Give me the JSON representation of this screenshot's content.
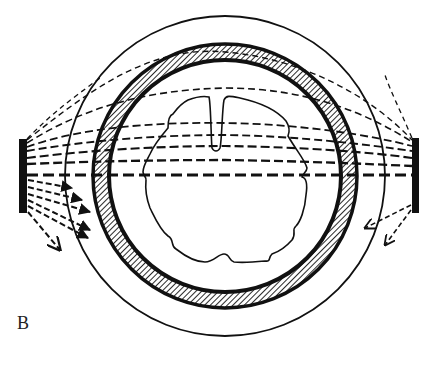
{
  "figure": {
    "panel_label": "B",
    "colors": {
      "ink": "#111111",
      "background": "#ffffff"
    },
    "elements": {
      "outer_circle": {
        "cx": 225,
        "cy": 176,
        "r": 160
      },
      "skull_ring": {
        "cx": 225,
        "cy": 176,
        "r_outer": 133,
        "r_inner": 115,
        "fill": "hatched"
      },
      "left_source_bar": {
        "x": 19,
        "y": 139,
        "width": 8,
        "height": 74
      },
      "right_source_bar": {
        "x": 412,
        "y": 138,
        "width": 7,
        "height": 75
      },
      "brain_outline": "irregular lobed contour with midline notch at top",
      "rays_through": 8,
      "scattered_arrows_left": 6,
      "scattered_arrows_right": 2
    }
  }
}
